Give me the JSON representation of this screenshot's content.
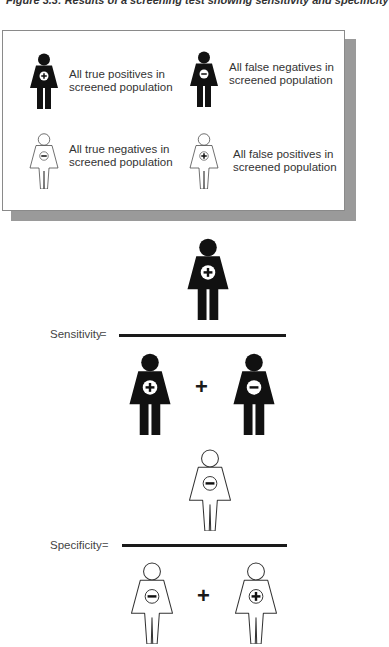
{
  "title": "Figure 3.3:    Results of a screening test showing sensitivity and specificity",
  "legend": {
    "items": [
      {
        "figure": "filled-person-plus-icon",
        "line1": "All true positives in",
        "line2": "screened population"
      },
      {
        "figure": "filled-person-minus-icon",
        "line1": "All false negatives in",
        "line2": "screened population"
      },
      {
        "figure": "outline-person-minus-icon",
        "line1": "All true negatives in",
        "line2": "screened population"
      },
      {
        "figure": "outline-person-plus-icon",
        "line1": "All false positives in",
        "line2": "screened population"
      }
    ]
  },
  "sensitivity": {
    "label": "Sensitivity",
    "equals": "=",
    "numerator": [
      "true-positive"
    ],
    "denominator": [
      "true-positive",
      "false-negative"
    ],
    "operator": "+"
  },
  "specificity": {
    "label": "Specificity",
    "equals": "=",
    "numerator": [
      "true-negative"
    ],
    "denominator": [
      "true-negative",
      "false-positive"
    ],
    "operator": "+"
  },
  "colors": {
    "filled": "#111111",
    "outline": "#333333",
    "shadow": "#9a9a9a"
  }
}
